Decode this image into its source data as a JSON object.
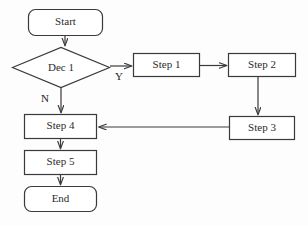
{
  "diagram": {
    "background_color": "#fdfdfd",
    "stroke_color": "#3a3a3a",
    "text_color": "#2b2b2b",
    "fill_color": "#ffffff",
    "nodes": [
      {
        "id": "start",
        "label": "Start",
        "shape": "rounded-rect",
        "x": 28,
        "y": 9,
        "w": 75,
        "h": 27
      },
      {
        "id": "dec1",
        "label": "Dec 1",
        "shape": "diamond",
        "x": 12,
        "y": 47,
        "w": 98,
        "h": 41
      },
      {
        "id": "step1",
        "label": "Step 1",
        "shape": "rect",
        "x": 133,
        "y": 53,
        "w": 67,
        "h": 24
      },
      {
        "id": "step2",
        "label": "Step 2",
        "shape": "rect",
        "x": 228,
        "y": 53,
        "w": 68,
        "h": 24
      },
      {
        "id": "step3",
        "label": "Step 3",
        "shape": "rect",
        "x": 229,
        "y": 116,
        "w": 66,
        "h": 24
      },
      {
        "id": "step4",
        "label": "Step 4",
        "shape": "rect",
        "x": 24,
        "y": 114,
        "w": 73,
        "h": 25
      },
      {
        "id": "step5",
        "label": "Step 5",
        "shape": "rect",
        "x": 24,
        "y": 150,
        "w": 73,
        "h": 25
      },
      {
        "id": "end",
        "label": "End",
        "shape": "rounded-rect",
        "x": 24,
        "y": 186,
        "w": 73,
        "h": 26
      }
    ],
    "edges": [
      {
        "id": "e-start-dec1",
        "from": "start",
        "to": "dec1",
        "label": ""
      },
      {
        "id": "e-dec1-step1",
        "from": "dec1",
        "to": "step1",
        "label": "Y"
      },
      {
        "id": "e-dec1-step4",
        "from": "dec1",
        "to": "step4",
        "label": "N"
      },
      {
        "id": "e-step1-step2",
        "from": "step1",
        "to": "step2",
        "label": ""
      },
      {
        "id": "e-step2-step3",
        "from": "step2",
        "to": "step3",
        "label": ""
      },
      {
        "id": "e-step3-step4",
        "from": "step3",
        "to": "step4",
        "label": ""
      },
      {
        "id": "e-step4-step5",
        "from": "step4",
        "to": "step5",
        "label": ""
      },
      {
        "id": "e-step5-end",
        "from": "step5",
        "to": "end",
        "label": ""
      }
    ],
    "edge_labels": {
      "yes": "Y",
      "no": "N"
    }
  }
}
